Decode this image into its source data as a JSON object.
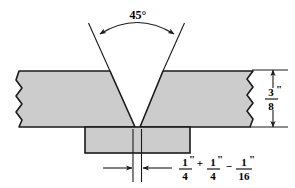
{
  "drawing": {
    "title": "Single-V Groove Butt Weld Joint Detail",
    "colors": {
      "plate_fill": "#cccccc",
      "backing_fill": "#cccccc",
      "line": "#1a1a1a",
      "background": "#ffffff"
    },
    "angle_dimension": {
      "label": "45°",
      "value": 45,
      "unit": "degrees",
      "description": "included groove angle"
    },
    "thickness_dimension": {
      "numerator": "3",
      "denominator": "8",
      "unit_mark": "\"",
      "label": "3/8\"",
      "description": "plate thickness"
    },
    "root_gap_dimension": {
      "base": {
        "numerator": "1",
        "denominator": "4",
        "unit_mark": "\""
      },
      "plus_sign": "+",
      "plus_tolerance": {
        "numerator": "1",
        "denominator": "4",
        "unit_mark": "\""
      },
      "minus_sign": "−",
      "minus_tolerance": {
        "numerator": "1",
        "denominator": "16",
        "unit_mark": "\""
      },
      "label": "1/4\" + 1/4\" − 1/16\"",
      "description": "root opening with tolerance"
    },
    "parts": {
      "left_plate": "left-plate",
      "right_plate": "right-plate",
      "backing_bar": "backing-bar"
    }
  }
}
